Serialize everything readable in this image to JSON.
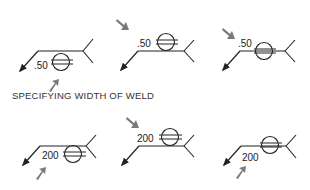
{
  "caption": "SPECIFYING WIDTH OF WELD",
  "colors": {
    "line": "#222222",
    "pointer": "#7a7a7a"
  },
  "rows": [
    {
      "value_label": ".50",
      "symbols": [
        {
          "position": "arrow-side",
          "pointer": "below-pointing-up"
        },
        {
          "position": "other-side",
          "pointer": "above-pointing-down"
        },
        {
          "position": "centered",
          "pointer": "above-pointing-down"
        }
      ]
    },
    {
      "value_label": "200",
      "symbols": [
        {
          "position": "arrow-side",
          "pointer": "below-pointing-up"
        },
        {
          "position": "other-side",
          "pointer": "above-pointing-down"
        },
        {
          "position": "centered",
          "pointer": "below-pointing-up"
        }
      ]
    }
  ],
  "labels": {
    "r0s0": ".50",
    "r0s1": ".50",
    "r0s2": ".50",
    "r1s0": "200",
    "r1s1": "200",
    "r1s2": "200"
  }
}
